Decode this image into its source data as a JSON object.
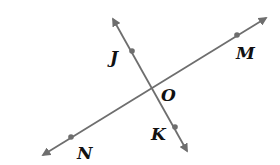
{
  "diagram": {
    "type": "intersecting-lines",
    "line_color": "#6e6e6e",
    "label_color": "#111111",
    "intersection": {
      "label": "O",
      "x": 150,
      "y": 84
    },
    "lines": [
      {
        "name": "JK",
        "from": {
          "x": 113,
          "y": 19
        },
        "to": {
          "x": 187,
          "y": 151
        },
        "arrows": "both"
      },
      {
        "name": "NM",
        "from": {
          "x": 43,
          "y": 155
        },
        "to": {
          "x": 266,
          "y": 18
        },
        "arrows": "both"
      }
    ],
    "points": [
      {
        "label": "J",
        "x": 132,
        "y": 51
      },
      {
        "label": "K",
        "x": 175,
        "y": 127
      },
      {
        "label": "M",
        "x": 237,
        "y": 35
      },
      {
        "label": "N",
        "x": 71,
        "y": 137
      }
    ],
    "labels": {
      "J": "J",
      "K": "K",
      "M": "M",
      "N": "N",
      "O": "O"
    }
  }
}
